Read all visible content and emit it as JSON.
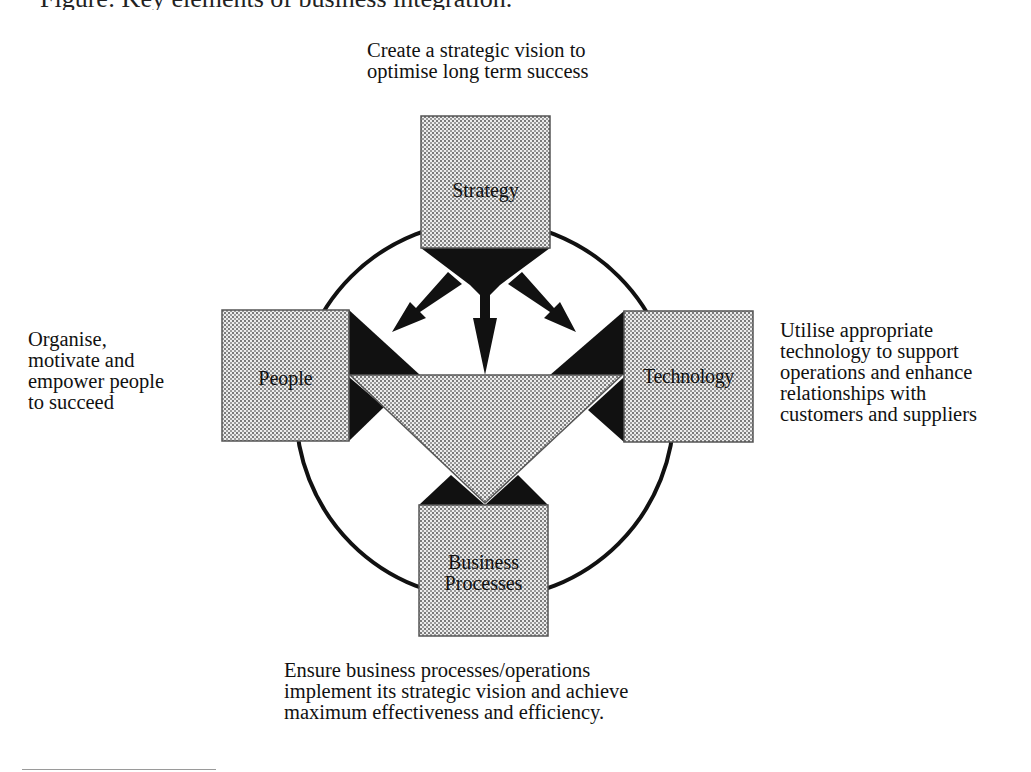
{
  "figure": {
    "title_cropped": "Figure: Key elements of business integration."
  },
  "nodes": {
    "strategy": {
      "label": "Strategy"
    },
    "people": {
      "label": "People"
    },
    "technology": {
      "label": "Technology"
    },
    "business_processes": {
      "label": "Business\nProcesses"
    }
  },
  "captions": {
    "strategy": "Create a strategic vision to\noptimise long term success",
    "people": "Organise,\nmotivate and\nempower people\nto succeed",
    "technology": "Utilise appropriate\ntechnology to support\noperations and enhance\nrelationships with\ncustomers and suppliers",
    "business_processes": "Ensure business processes/operations\nimplement its strategic vision and achieve\nmaximum effectiveness and efficiency."
  },
  "style": {
    "box_fill": "#d9d9d9",
    "connector_fill": "#111111",
    "circle_stroke": "#111111"
  }
}
